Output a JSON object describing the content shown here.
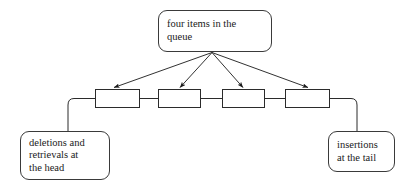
{
  "diagram": {
    "title_box": {
      "name": "four-items-label",
      "lines": [
        "four items in the",
        "queue"
      ]
    },
    "head_box": {
      "name": "head-operations-label",
      "lines": [
        "deletions and",
        "retrievals at",
        "the head"
      ]
    },
    "tail_box": {
      "name": "tail-operations-label",
      "lines": [
        "insertions",
        "at the tail"
      ]
    },
    "queue_nodes": [
      {
        "label": ""
      },
      {
        "label": ""
      },
      {
        "label": ""
      },
      {
        "label": ""
      }
    ],
    "node_count": 4,
    "colors": {
      "stroke": "#2b2b2b",
      "box_stroke": "#3a3a3a",
      "text": "#1a1a1a",
      "background": "#ffffff"
    }
  }
}
